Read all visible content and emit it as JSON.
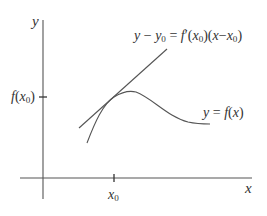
{
  "diagram": {
    "type": "tangent-line-illustration",
    "colors": {
      "stroke": "#555555",
      "text": "#333333",
      "background": "#ffffff"
    },
    "axes": {
      "y_label": "y",
      "x_label": "x"
    },
    "ticks": {
      "y_tick_label_fn": "f",
      "y_tick_label_arg": "x",
      "y_tick_label_sub": "0",
      "x_tick_label": "x",
      "x_tick_label_sub": "0"
    },
    "tangent_label": {
      "lhs_y": "y",
      "minus": " − ",
      "lhs_y0": "y",
      "lhs_y0_sub": "0",
      "equals": " = ",
      "rhs_f": "f",
      "rhs_prime": "′",
      "rhs_open": "(",
      "rhs_x": "x",
      "rhs_x_sub": "0",
      "rhs_close_open": ")(",
      "rhs_x2": "x",
      "rhs_minus": "−",
      "rhs_x3": "x",
      "rhs_x3_sub": "0",
      "rhs_close": ")"
    },
    "curve_label": {
      "y": "y",
      "equals": " = ",
      "f": "f",
      "open": "(",
      "x": "x",
      "close": ")"
    }
  }
}
